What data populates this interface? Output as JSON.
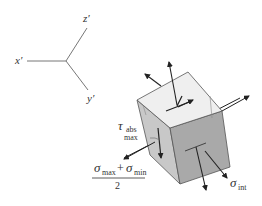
{
  "axes": {
    "x_label": "x′",
    "y_label": "y′",
    "z_label": "z′"
  },
  "labels": {
    "tau_symbol": "τ",
    "tau_sub_top": "abs",
    "tau_sub_bottom": "max",
    "sigma_int_symbol": "σ",
    "sigma_int_sub": "int",
    "fraction_num_sigma1": "σ",
    "fraction_num_sub1": "max",
    "fraction_plus": "+",
    "fraction_num_sigma2": "σ",
    "fraction_num_sub2": "min",
    "fraction_den": "2"
  },
  "colors": {
    "top_face": "#efefef",
    "left_face": "#c8c8c8",
    "front_face": "#a9a9a9",
    "edge": "#555555",
    "arrow": "#222222"
  }
}
